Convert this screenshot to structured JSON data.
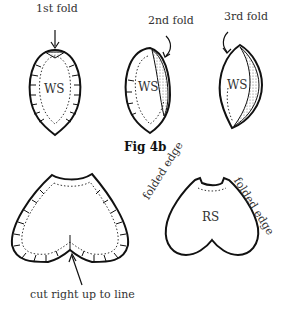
{
  "figure_top": {
    "caption": "Fig 4b",
    "steps": [
      {
        "label": "1st fold",
        "side": "WS"
      },
      {
        "label": "2nd fold",
        "side": "WS"
      },
      {
        "label": "3rd fold",
        "side": "WS"
      }
    ]
  },
  "figure_bottom": {
    "left_annotation": "cut right up to line",
    "right_side": "RS",
    "left_edge_label": "folded edge",
    "right_edge_label": "folded edge"
  }
}
